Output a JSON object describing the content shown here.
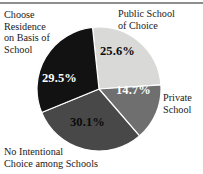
{
  "chart_data": {
    "type": "pie",
    "title": "",
    "subtitle": "",
    "xlabel": "",
    "ylabel": "",
    "legend_position": "outside-callouts",
    "grid": false,
    "units": "percent",
    "total": 99.9,
    "categories": [
      "Public School of Choice",
      "Private School",
      "No Intentional Choice among Schools",
      "Choose Residence on Basis of School"
    ],
    "values": [
      25.6,
      14.7,
      30.1,
      29.5
    ],
    "value_labels": [
      "25.6%",
      "14.7%",
      "30.1%",
      "29.5%"
    ],
    "colors": [
      "#d9d9d7",
      "#6f6f6f",
      "#484848",
      "#121212"
    ],
    "slices": [
      {
        "name": "public-school-of-choice",
        "label": "Public School\nof Choice",
        "value": 25.6,
        "value_label": "25.6%",
        "color": "#d9d9d7",
        "label_color": "#0b0b0b"
      },
      {
        "name": "private-school",
        "label": "Private\nSchool",
        "value": 14.7,
        "value_label": "14.7%",
        "color": "#6f6f6f",
        "label_color": "#ffffff"
      },
      {
        "name": "no-intentional-choice",
        "label": "No Intentional\nChoice among Schools",
        "value": 30.1,
        "value_label": "30.1%",
        "color": "#484848",
        "label_color": "#0b0b0b"
      },
      {
        "name": "choose-residence",
        "label": "Choose\nResidence\non Basis of\nSchool",
        "value": 29.5,
        "value_label": "29.5%",
        "color": "#121212",
        "label_color": "#ffffff"
      }
    ]
  },
  "figure": {
    "pie": {
      "center_x": 63,
      "center_y": 63,
      "radius": 62,
      "start_angle_deg": -6,
      "direction": "clockwise",
      "stroke": "#ffffff",
      "stroke_width": 1.2
    },
    "rule_color": "#8e8e8e"
  }
}
